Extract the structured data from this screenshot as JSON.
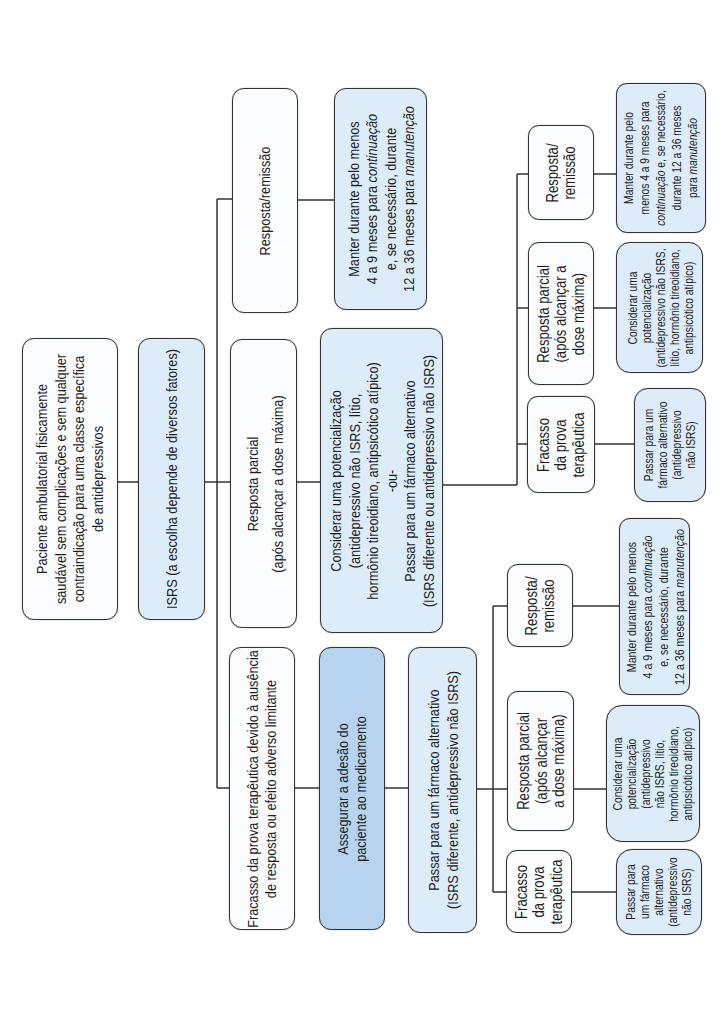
{
  "colors": {
    "box_white": "#fafcfe",
    "box_light_blue": "#dcecf8",
    "box_medium_blue": "#b6d4ef",
    "border": "#333333",
    "line": "#333333"
  },
  "diagram": {
    "root_patient": {
      "lines": [
        "Paciente ambulatorial fisicamente",
        "saudável sem complicações e sem qualquer",
        "contraindicação para uma classe específica",
        "de antidepressivos"
      ]
    },
    "first_line_isrs": {
      "lines": [
        "ISRS (a escolha depende de diversos fatores)"
      ]
    },
    "response_remission": {
      "lines": [
        "Resposta/remissão"
      ]
    },
    "partial_response": {
      "lines": [
        "Resposta parcial",
        "(após alcançar a dose máxima)"
      ]
    },
    "treatment_failure": {
      "lines": [
        "Fracasso da prova terapêutica devido à ausência",
        "de resposta ou efeito adverso limitante"
      ]
    },
    "maintain": {
      "lines": [
        "Manter durante pelo menos",
        {
          "pre": "4 a 9 meses para ",
          "em": "continuação"
        },
        "e, se necessário, durante",
        {
          "pre": "12 a 36 meses para ",
          "em": "manutenção"
        }
      ]
    },
    "augment_or_switch": {
      "lines": [
        "Considerar uma potencialização",
        "(antidepressivo não ISRS, lítio,",
        "hormônio tireoidiano, antipsicótico atípico)",
        "-ou-",
        "Passar para um fármaco alternativo",
        "(ISRS diferente ou antidepressivo não ISRS)"
      ]
    },
    "ensure_adherence": {
      "lines": [
        "Assegurar a adesão do",
        "paciente ao medicamento"
      ]
    },
    "switch_drug": {
      "lines": [
        "Passar para um fármaco alternativo",
        "(ISRS diferente, antidepressivo não ISRS)"
      ]
    },
    "branch_after_augment": {
      "response_remission": {
        "lines": [
          "Resposta/",
          "remissão"
        ]
      },
      "maintain": {
        "lines": [
          "Manter durante pelo",
          "menos 4 a 9 meses para",
          {
            "em": "continuação",
            "post": " e, se necessário,"
          },
          "durante 12 a 36 meses",
          {
            "pre": "para ",
            "em": "manutenção"
          }
        ]
      },
      "partial_response": {
        "lines": [
          "Resposta parcial",
          "(após alcançar a",
          "dose máxima)"
        ]
      },
      "augment": {
        "lines": [
          "Considerar uma",
          "potencialização",
          "(antidepressivo não ISRS,",
          "lítio, hormônio tireoidiano,",
          "antipsicótico atípico)"
        ]
      },
      "failure": {
        "lines": [
          "Fracasso",
          "da prova",
          "terapêutica"
        ]
      },
      "switch": {
        "lines": [
          "Passar para um",
          "fármaco alternativo",
          "(antidepressivo",
          "não ISRS)"
        ]
      }
    },
    "branch_after_switch": {
      "response_remission": {
        "lines": [
          "Resposta/",
          "remissão"
        ]
      },
      "maintain": {
        "lines": [
          "Manter durante pelo menos",
          {
            "pre": "4 a 9 meses para ",
            "em": "continuação"
          },
          "e, se necessário, durante",
          {
            "pre": "12 a 36 meses para ",
            "em": "manutenção"
          }
        ]
      },
      "partial_response": {
        "lines": [
          "Resposta parcial",
          "(após alcançar",
          "a dose máxima)"
        ]
      },
      "augment": {
        "lines": [
          "Considerar uma",
          "potencialização",
          "(antidepressivo",
          "não ISRS, lítio,",
          "hormônio tireoidiano,",
          "antipsicótico atípico)"
        ]
      },
      "failure": {
        "lines": [
          "Fracasso",
          "da prova",
          "terapêutica"
        ]
      },
      "switch": {
        "lines": [
          "Passar para",
          "um fármaco",
          "alternativo",
          "(antidepressivo",
          "não ISRS)"
        ]
      }
    }
  }
}
